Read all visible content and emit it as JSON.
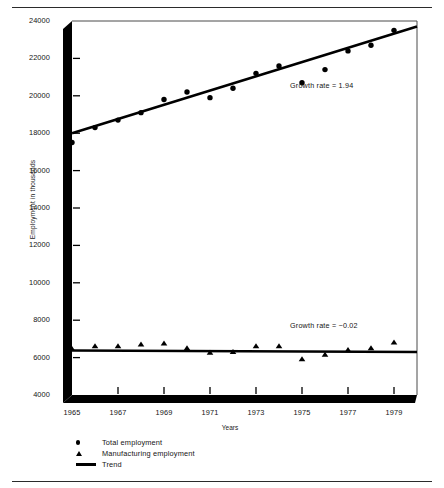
{
  "chart_data": {
    "type": "scatter",
    "title": "",
    "xlabel": "Years",
    "ylabel": "Employment in thousands",
    "xlim": [
      1965,
      1980
    ],
    "ylim": [
      4000,
      24000
    ],
    "grid": false,
    "legend_position": "below-axes-left",
    "x": [
      1965,
      1966,
      1967,
      1968,
      1969,
      1970,
      1971,
      1972,
      1973,
      1974,
      1975,
      1976,
      1977,
      1978,
      1979
    ],
    "series": [
      {
        "name": "Total employment",
        "marker": "dot",
        "values": [
          17500,
          18300,
          18700,
          19100,
          19800,
          20200,
          19900,
          20400,
          21200,
          21600,
          20700,
          21400,
          22400,
          22700,
          23500
        ]
      },
      {
        "name": "Manufacturing employment",
        "marker": "triangle",
        "values": [
          6450,
          6600,
          6600,
          6700,
          6750,
          6500,
          6250,
          6300,
          6600,
          6600,
          5900,
          6150,
          6400,
          6500,
          6800
        ]
      }
    ],
    "trend_lines": [
      {
        "name": "Total employment trend",
        "growth_rate": 1.94,
        "start": {
          "x": 1965,
          "y": 18000
        },
        "end": {
          "x": 1980,
          "y": 23700
        }
      },
      {
        "name": "Manufacturing employment trend",
        "growth_rate": -0.02,
        "start": {
          "x": 1965,
          "y": 6380
        },
        "end": {
          "x": 1980,
          "y": 6300
        }
      }
    ],
    "annotations": [
      {
        "text": "Growth rate = 1.94",
        "x": 1977.0,
        "y": 20500
      },
      {
        "text": "Growth rate = −0.02",
        "x": 1977.0,
        "y": 7700
      }
    ],
    "ytick_labels": [
      "24000",
      "22000",
      "20000",
      "18000",
      "16000",
      "14000",
      "12000",
      "10000",
      "8000",
      "6000",
      "4000"
    ],
    "ytick_values": [
      24000,
      22000,
      20000,
      18000,
      16000,
      14000,
      12000,
      10000,
      8000,
      6000,
      4000
    ],
    "xtick_labels": [
      "1965",
      "1967",
      "1969",
      "1971",
      "1973",
      "1975",
      "1977",
      "1979"
    ],
    "xtick_values": [
      1965,
      1967,
      1969,
      1971,
      1973,
      1975,
      1977,
      1979
    ]
  },
  "legend": {
    "items": [
      {
        "label": "Total employment",
        "marker": "dot-marker"
      },
      {
        "label": "Manufacturing employment",
        "marker": "triangle-marker"
      },
      {
        "label": "Trend",
        "marker": "line-marker"
      }
    ]
  },
  "axes": {
    "ylabel": "Employment in thousands",
    "xlabel": "Years"
  },
  "annotations": {
    "total_growth": "Growth rate = 1.94",
    "manufacturing_growth": "Growth rate = −0.02"
  },
  "colors": {
    "ink": "#000000",
    "background": "#ffffff",
    "rule": "#2b2b2b"
  }
}
